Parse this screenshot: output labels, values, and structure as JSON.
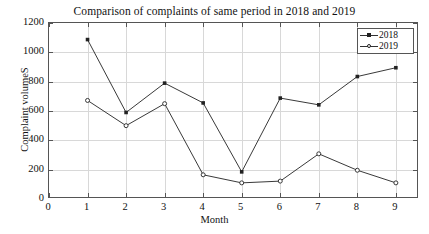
{
  "chart_data": {
    "type": "line",
    "title": "Comparison of complaints of same period in 2018 and 2019",
    "xlabel": "Month",
    "ylabel": "Complaint volumeS",
    "x": [
      1,
      2,
      3,
      4,
      5,
      6,
      7,
      8,
      9
    ],
    "xlim": [
      0,
      9.6
    ],
    "ylim": [
      0,
      1200
    ],
    "xticks": [
      0,
      1,
      2,
      3,
      4,
      5,
      6,
      7,
      8,
      9
    ],
    "yticks": [
      0,
      200,
      400,
      600,
      800,
      1000,
      1200
    ],
    "xtick_labels": [
      "0",
      "1",
      "2",
      "3",
      "4",
      "5",
      "6",
      "7",
      "8",
      "9"
    ],
    "ytick_labels": [
      "0",
      "200",
      "400",
      "600",
      "800",
      "1000",
      "1200"
    ],
    "grid": true,
    "legend_position": "top-right",
    "series": [
      {
        "name": "2018",
        "marker": "square",
        "color": "#222222",
        "values": [
          1087,
          590,
          790,
          655,
          185,
          688,
          642,
          835,
          895
        ]
      },
      {
        "name": "2019",
        "marker": "circle",
        "color": "#222222",
        "values": [
          672,
          500,
          650,
          165,
          110,
          122,
          308,
          196,
          110
        ]
      }
    ]
  },
  "legend": {
    "items": [
      {
        "label": "2018",
        "marker": "square-marker"
      },
      {
        "label": "2019",
        "marker": "circle-marker"
      }
    ]
  },
  "axes": {
    "x_title": "Month",
    "y_title": "Complaint volumeS"
  }
}
